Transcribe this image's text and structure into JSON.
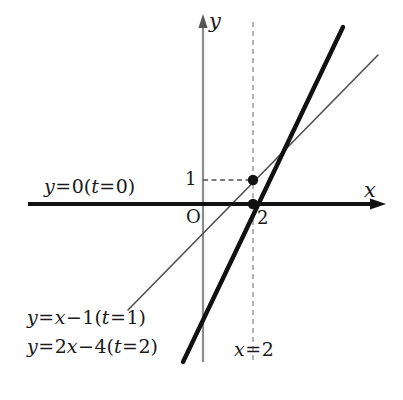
{
  "figure": {
    "type": "math-diagram",
    "background_color": "#ffffff",
    "width": 403,
    "height": 400
  },
  "axes": {
    "x_axis_label": "x",
    "y_axis_label": "y",
    "origin_label": "O",
    "x_axis_color": "#111111",
    "y_axis_color": "#8c8c8c",
    "x_axis_pixel_y": 204,
    "y_axis_pixel_x": 203,
    "units_per_pixel_x": 25,
    "units_per_pixel_y": 24
  },
  "ticks": {
    "y_ticks": [
      {
        "label": "1",
        "value": 1
      }
    ],
    "x_ticks": [
      {
        "label": "2",
        "value": 2
      }
    ]
  },
  "labels": {
    "line_t0": {
      "parts": [
        {
          "text": "y",
          "kind": "var"
        },
        {
          "text": "=",
          "kind": "op"
        },
        {
          "text": "0",
          "kind": "num"
        },
        {
          "text": "(",
          "kind": "paren"
        },
        {
          "text": "t",
          "kind": "var"
        },
        {
          "text": "=",
          "kind": "op"
        },
        {
          "text": "0",
          "kind": "num"
        },
        {
          "text": ")",
          "kind": "paren"
        }
      ],
      "plain": "y=0(t=0)"
    },
    "line_t1": {
      "parts": [
        {
          "text": "y",
          "kind": "var"
        },
        {
          "text": "=",
          "kind": "op"
        },
        {
          "text": "x",
          "kind": "var"
        },
        {
          "text": "−",
          "kind": "op"
        },
        {
          "text": "1",
          "kind": "num"
        },
        {
          "text": "(",
          "kind": "paren"
        },
        {
          "text": "t",
          "kind": "var"
        },
        {
          "text": "=",
          "kind": "op"
        },
        {
          "text": "1",
          "kind": "num"
        },
        {
          "text": ")",
          "kind": "paren"
        }
      ],
      "plain": "y=x−1(t=1)"
    },
    "line_t2": {
      "parts": [
        {
          "text": "y",
          "kind": "var"
        },
        {
          "text": "=",
          "kind": "op"
        },
        {
          "text": "2",
          "kind": "num"
        },
        {
          "text": "x",
          "kind": "var"
        },
        {
          "text": "−",
          "kind": "op"
        },
        {
          "text": "4",
          "kind": "num"
        },
        {
          "text": "(",
          "kind": "paren"
        },
        {
          "text": "t",
          "kind": "var"
        },
        {
          "text": "=",
          "kind": "op"
        },
        {
          "text": "2",
          "kind": "num"
        },
        {
          "text": ")",
          "kind": "paren"
        }
      ],
      "plain": "y=2x−4(t=2)"
    },
    "vertical_line": {
      "parts": [
        {
          "text": "x",
          "kind": "var"
        },
        {
          "text": "=",
          "kind": "op"
        },
        {
          "text": "2",
          "kind": "num"
        }
      ],
      "plain": "x=2"
    }
  },
  "chart_data": {
    "type": "line",
    "title": "",
    "xlabel": "x",
    "ylabel": "y",
    "xlim": [
      -7,
      7.2
    ],
    "ylim": [
      -6.6,
      7.6
    ],
    "grid": false,
    "legend": "inline-annotations",
    "series": [
      {
        "name": "y=0(t=0)",
        "equation": "y = 0",
        "slope": 0,
        "intercept": 0,
        "style": "solid",
        "color": "#111111",
        "width_px": 4,
        "note": "coincides with the x-axis",
        "x": [
          -7,
          7.2
        ],
        "y": [
          0,
          0
        ]
      },
      {
        "name": "y=x-1(t=1)",
        "equation": "y = x - 1",
        "slope": 1,
        "intercept": -1,
        "style": "solid",
        "color": "#555555",
        "width_px": 1.4,
        "x": [
          -3,
          7
        ],
        "y": [
          -4,
          6
        ]
      },
      {
        "name": "y=2x-4(t=2)",
        "equation": "y = 2x - 4",
        "slope": 2,
        "intercept": -4,
        "style": "solid",
        "color": "#111111",
        "width_px": 4,
        "x": [
          -0.8,
          5.6
        ],
        "y": [
          -5.6,
          7.2
        ]
      },
      {
        "name": "x=2",
        "equation": "x = 2",
        "style": "dashed",
        "color": "#999999",
        "width_px": 1.4,
        "x": [
          2,
          2
        ],
        "y": [
          7.6,
          -6.6
        ]
      },
      {
        "name": "y=1 guide",
        "equation": "y = 1 (from y-axis to point)",
        "style": "dashed",
        "color": "#555555",
        "width_px": 1.2,
        "x": [
          0,
          2
        ],
        "y": [
          1,
          1
        ]
      }
    ],
    "points": [
      {
        "label": "",
        "x": 2,
        "y": 1,
        "marker": "filled-circle",
        "radius_px": 5
      },
      {
        "label": "",
        "x": 2,
        "y": 0,
        "marker": "filled-circle",
        "radius_px": 5
      }
    ],
    "annotations": [
      {
        "text": "y=0(t=0)",
        "x": -6.1,
        "y": 0.85
      },
      {
        "text": "y=x-1(t=1)",
        "x": -6.8,
        "y": -4.6
      },
      {
        "text": "y=2x-4(t=2)",
        "x": -6.8,
        "y": -5.8
      },
      {
        "text": "x=2",
        "x": 1.35,
        "y": -5.95
      },
      {
        "text": "1",
        "x": -0.65,
        "y": 1.05
      },
      {
        "text": "2",
        "x": 2.25,
        "y": -0.75
      },
      {
        "text": "O",
        "x": -0.6,
        "y": -0.7
      }
    ]
  }
}
